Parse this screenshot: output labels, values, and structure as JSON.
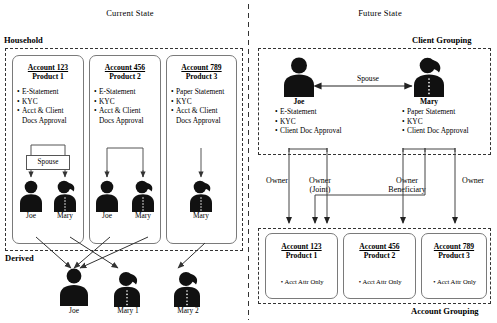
{
  "panels": {
    "current": {
      "title": "Current State",
      "group_label": "Household",
      "derived_label": "Derived"
    },
    "future": {
      "title": "Future State",
      "group_label": "Client Grouping",
      "account_group_label": "Account Grouping"
    }
  },
  "current_state": {
    "accounts": [
      {
        "id": "Account 123",
        "product": "Product 1",
        "attributes": [
          "E-Statement",
          "KYC",
          "Acct & Client"
        ],
        "attribute_wrap": "Docs Approval",
        "relationship_box": "Spouse",
        "people": [
          "Joe",
          "Mary"
        ]
      },
      {
        "id": "Account 456",
        "product": "Product 2",
        "attributes": [
          "E-Statement",
          "KYC",
          "Acct & Client"
        ],
        "attribute_wrap": "Docs Approval",
        "relationship_box": "",
        "people": [
          "Joe",
          "Mary"
        ]
      },
      {
        "id": "Account 789",
        "product": "Product 3",
        "attributes": [
          "Paper Statement",
          "KYC",
          "Acct & Client"
        ],
        "attribute_wrap": "Docs Approval",
        "relationship_box": "",
        "people": [
          "Mary"
        ]
      }
    ],
    "derived_people": [
      "Joe",
      "Mary 1",
      "Mary 2"
    ]
  },
  "future_state": {
    "clients": [
      {
        "name": "Joe",
        "gender": "male",
        "attributes": [
          "E-Statement",
          "KYC",
          "Client Doc Approval"
        ]
      },
      {
        "name": "Mary",
        "gender": "female",
        "attributes": [
          "Paper Statement",
          "KYC",
          "Client Doc Approval"
        ]
      }
    ],
    "client_relationship": "Spouse",
    "ownership_labels": [
      {
        "line1": "Owner",
        "line2": ""
      },
      {
        "line1": "Owner",
        "line2": "(Joint)"
      },
      {
        "line1": "Owner",
        "line2": "Beneficiary"
      },
      {
        "line1": "Owner",
        "line2": ""
      }
    ],
    "accounts": [
      {
        "id": "Account 123",
        "product": "Product 1",
        "attributes": [
          "Acct Attr Only"
        ]
      },
      {
        "id": "Account 456",
        "product": "Product 2",
        "attributes": [
          "Acct Attr Only"
        ]
      },
      {
        "id": "Account 789",
        "product": "Product 3",
        "attributes": [
          "Acct Attr Only"
        ]
      }
    ]
  },
  "colors": {
    "ink": "#000000",
    "frame_dashed": "#333333",
    "card_border": "#7a7a7a",
    "line": "#444444"
  }
}
